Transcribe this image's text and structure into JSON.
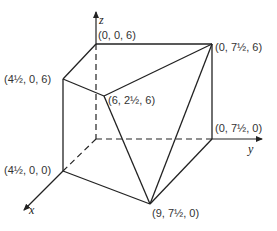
{
  "diagram": {
    "type": "3d-solid-coordinate-figure",
    "axes": {
      "x": {
        "label": "x"
      },
      "y": {
        "label": "y"
      },
      "z": {
        "label": "z"
      }
    },
    "points": [
      {
        "id": "P1",
        "label": "(0, 0, 6)",
        "coords": [
          0,
          0,
          6
        ]
      },
      {
        "id": "P2",
        "label": "(0, 7½, 6)",
        "coords": [
          0,
          7.5,
          6
        ]
      },
      {
        "id": "P3",
        "label": "(4½, 0, 6)",
        "coords": [
          4.5,
          0,
          6
        ]
      },
      {
        "id": "P4",
        "label": "(6, 2½, 6)",
        "coords": [
          6,
          2.5,
          6
        ]
      },
      {
        "id": "P5",
        "label": "(0, 7½, 0)",
        "coords": [
          0,
          7.5,
          0
        ]
      },
      {
        "id": "P6",
        "label": "(4½, 0, 0)",
        "coords": [
          4.5,
          0,
          0
        ]
      },
      {
        "id": "P7",
        "label": "(9, 7½, 0)",
        "coords": [
          9,
          7.5,
          0
        ]
      }
    ],
    "colors": {
      "line": "#222222",
      "background": "#ffffff",
      "text": "#333333"
    }
  }
}
